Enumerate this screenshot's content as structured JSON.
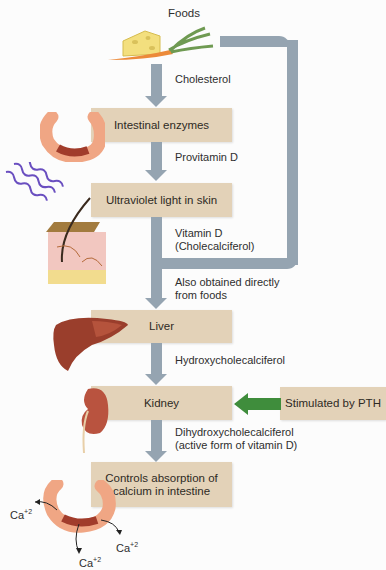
{
  "diagram": {
    "colors": {
      "box_fill": "#e3d2b8",
      "arrow_gray": "#95a4b1",
      "arrow_green": "#3f8d3c",
      "background": "#fcfcfc"
    },
    "top_label": "Foods",
    "steps": [
      {
        "box": "Intestinal enzymes",
        "input_label": "Cholesterol",
        "icon": "intestine-icon"
      },
      {
        "box": "Ultraviolet light in skin",
        "input_label": "Provitamin D",
        "icon": "skin-uv-icon"
      },
      {
        "box": "Liver",
        "input_label_line1": "Vitamin D",
        "input_label_line2": "(Cholecalciferol)",
        "icon": "liver-icon"
      },
      {
        "box": "Kidney",
        "input_label": "Hydroxycholecalciferol",
        "icon": "kidney-icon"
      },
      {
        "box_line1": "Controls absorption of",
        "box_line2": "calcium in intestine",
        "input_label_line1": "Dihydroxycholecalciferol",
        "input_label_line2": "(active form of vitamin D)",
        "icon": "intestine-calcium-icon"
      }
    ],
    "bypass_label_line1": "Also obtained directly",
    "bypass_label_line2": "from foods",
    "pth_box": "Stimulated by PTH",
    "calcium_label": "Ca",
    "calcium_charge": "+2"
  }
}
